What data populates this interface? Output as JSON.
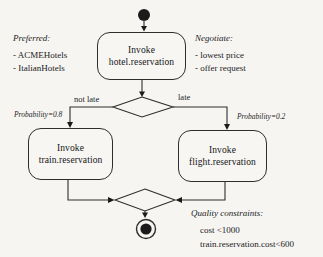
{
  "diagram": {
    "type": "uml-activity-diagram",
    "nodes": {
      "hotel": {
        "line1": "Invoke",
        "line2": "hotel.reservation"
      },
      "train": {
        "line1": "Invoke",
        "line2": "train.reservation"
      },
      "flight": {
        "line1": "Invoke",
        "line2": "flight.reservation"
      }
    },
    "edges": {
      "not_late_label": "not late",
      "late_label": "late",
      "prob_left": "Probability=0.8",
      "prob_right": "Probability=0.2"
    },
    "annotations": {
      "preferred": {
        "title": "Preferred:",
        "items": [
          "- ACMEHotels",
          "- ItalianHotels"
        ]
      },
      "negotiate": {
        "title": "Negotiate:",
        "items": [
          "- lowest price",
          "- offer request"
        ]
      },
      "quality": {
        "title": "Quality constraints:",
        "items": [
          "cost <1000",
          "train.reservation.cost<600"
        ]
      }
    },
    "colors": {
      "background": "#f6f5f2",
      "line": "#2e2e2e",
      "text": "#1b1b1b"
    }
  }
}
